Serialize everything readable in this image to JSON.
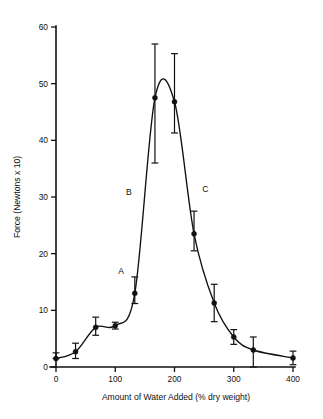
{
  "chart_data": {
    "type": "line",
    "title": "",
    "xlabel": "Amount of Water Added (% dry weight)",
    "ylabel": "Force (Newtons x 10)",
    "xlim": [
      0,
      400
    ],
    "ylim": [
      0,
      60
    ],
    "xticks": [
      0,
      100,
      200,
      300,
      400
    ],
    "yticks": [
      0,
      10,
      20,
      30,
      40,
      50,
      60
    ],
    "xtick_labels": [
      "0",
      "100",
      "200",
      "300",
      "400"
    ],
    "ytick_labels": [
      "0",
      "10",
      "20",
      "30",
      "40",
      "50",
      "60"
    ],
    "grid": false,
    "legend": false,
    "series": [
      {
        "name": "Force vs water added",
        "marker": "filled-circle",
        "line": "smooth-solid",
        "x": [
          0,
          33,
          67,
          100,
          133,
          167,
          200,
          233,
          267,
          300,
          333,
          400
        ],
        "y": [
          1.5,
          2.7,
          7.0,
          7.3,
          13.0,
          47.5,
          46.8,
          23.5,
          11.3,
          5.3,
          3.0,
          1.6
        ],
        "yerr_upper": [
          1.0,
          1.5,
          1.8,
          0.6,
          2.9,
          9.5,
          8.5,
          4.0,
          3.3,
          1.3,
          2.3,
          1.2
        ],
        "yerr_lower": [
          0.0,
          1.2,
          1.4,
          0.6,
          1.8,
          11.5,
          5.5,
          3.0,
          3.3,
          1.3,
          3.0,
          1.2
        ]
      }
    ],
    "annotations": [
      {
        "label": "A",
        "x": 110,
        "y": 16.5
      },
      {
        "label": "B",
        "x": 123,
        "y": 30.3
      },
      {
        "label": "C",
        "x": 252,
        "y": 30.8
      }
    ]
  },
  "colors": {
    "ink": "#111111",
    "background": "#ffffff"
  }
}
